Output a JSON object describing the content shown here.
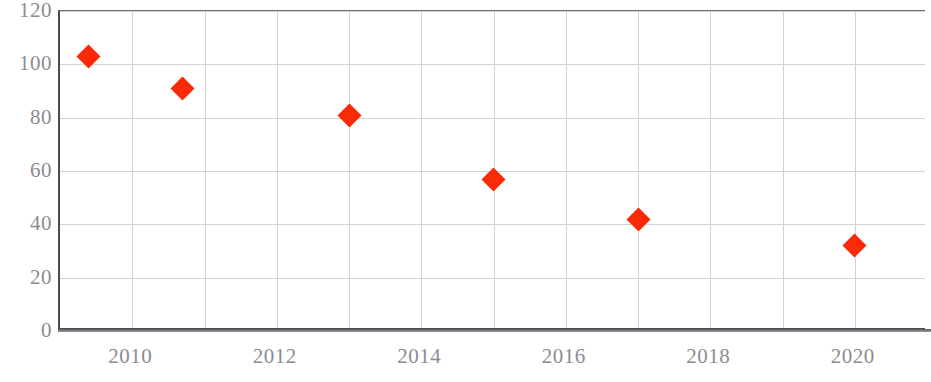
{
  "chart_data": {
    "type": "scatter",
    "title": "",
    "subtitle": "",
    "xlabel": "",
    "ylabel": "",
    "xlim": [
      2009,
      2021
    ],
    "ylim": [
      0,
      120
    ],
    "grid": true,
    "legend": null,
    "marker": {
      "shape": "diamond",
      "color": "#fa2a09",
      "size_px": 17
    },
    "series": [
      {
        "name": "series-1",
        "color": "#fa2a09",
        "x": [
          2009.4,
          2010.7,
          2013.0,
          2015.0,
          2017.0,
          2020.0
        ],
        "values": [
          103,
          91,
          81,
          57,
          42,
          32
        ],
        "points": [
          {
            "x": 2009.4,
            "y": 103
          },
          {
            "x": 2010.7,
            "y": 91
          },
          {
            "x": 2013.0,
            "y": 81
          },
          {
            "x": 2015.0,
            "y": 57
          },
          {
            "x": 2017.0,
            "y": 42
          },
          {
            "x": 2020.0,
            "y": 32
          }
        ]
      }
    ],
    "yticks": [
      0,
      20,
      40,
      60,
      80,
      100,
      120
    ],
    "ytick_labels": [
      "0",
      "20",
      "40",
      "60",
      "80",
      "100",
      "120"
    ],
    "xticks": [
      2010,
      2012,
      2014,
      2016,
      2018,
      2020
    ],
    "xtick_labels": [
      "2010",
      "2012",
      "2014",
      "2016",
      "2018",
      "2020"
    ],
    "colors": {
      "marker": "#fa2a09",
      "gridline": "#d2d2d4",
      "axis": "#4a4a4f",
      "tick_text": "#8b8b90",
      "background": "#ffffff"
    }
  },
  "axes": {
    "y_tick_labels": [
      "120",
      "100",
      "80",
      "60",
      "40",
      "20",
      "0"
    ],
    "x_tick_labels": [
      "2010",
      "2012",
      "2014",
      "2016",
      "2018",
      "2020"
    ]
  }
}
